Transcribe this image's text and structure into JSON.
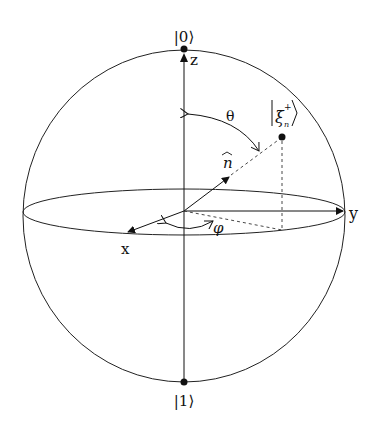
{
  "diagram": {
    "type": "bloch-sphere",
    "colors": {
      "stroke": "#222222",
      "background": "#ffffff"
    },
    "poles": {
      "top_label": "|0⟩",
      "bottom_label": "|1⟩"
    },
    "axes": {
      "z_label": "z",
      "x_label": "x",
      "y_label": "y"
    },
    "vector": {
      "label": "n",
      "hat": "^"
    },
    "state": {
      "symbol": "ξ",
      "superscript": "+",
      "subscript": "n",
      "left_bracket": "|",
      "right_bracket": "⟩"
    },
    "angles": {
      "polar": "θ",
      "azimuthal": "φ"
    }
  }
}
